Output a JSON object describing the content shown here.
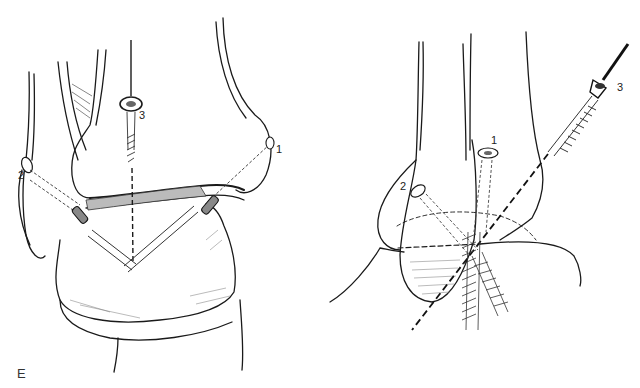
{
  "figure": {
    "panel_label": "E",
    "left_view": {
      "description": "Anterior view of ankle mortise with three screw fixation",
      "labels": [
        {
          "id": "screw-1",
          "text": "1",
          "x": 276,
          "y": 144
        },
        {
          "id": "screw-2",
          "text": "2",
          "x": 18,
          "y": 170
        },
        {
          "id": "screw-3",
          "text": "3",
          "x": 139,
          "y": 110
        }
      ]
    },
    "right_view": {
      "description": "Lateral view of ankle with screw fixation and guide wire",
      "labels": [
        {
          "id": "screw-1",
          "text": "1",
          "x": 491,
          "y": 135
        },
        {
          "id": "screw-2",
          "text": "2",
          "x": 400,
          "y": 181
        },
        {
          "id": "screw-3",
          "text": "3",
          "x": 617,
          "y": 82
        }
      ]
    },
    "colors": {
      "ink": "#1a1a1a",
      "hatch": "#555555",
      "background": "#ffffff"
    }
  }
}
